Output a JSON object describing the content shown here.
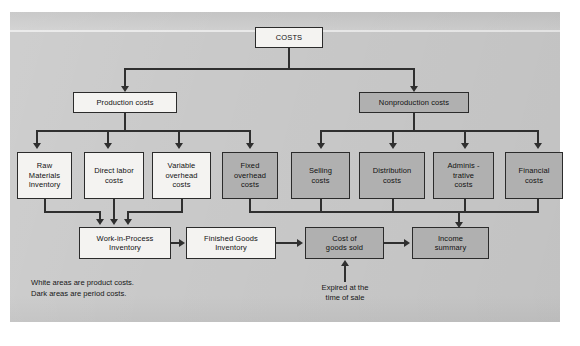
{
  "diagram": {
    "root": {
      "label": "COSTS",
      "fill": "white"
    },
    "branches": [
      {
        "label": "Production costs",
        "fill": "white"
      },
      {
        "label": "Nonproduction costs",
        "fill": "dark"
      }
    ],
    "production_children": [
      {
        "label": "Raw\nMaterials\nInventory",
        "fill": "white"
      },
      {
        "label": "Direct labor\ncosts",
        "fill": "white"
      },
      {
        "label": "Variable\noverhead\ncosts",
        "fill": "white"
      },
      {
        "label": "Fixed\noverhead\ncosts",
        "fill": "dark"
      }
    ],
    "nonproduction_children": [
      {
        "label": "Selling\ncosts",
        "fill": "dark"
      },
      {
        "label": "Distribution\ncosts",
        "fill": "dark"
      },
      {
        "label": "Adminis -\ntrative\ncosts",
        "fill": "dark"
      },
      {
        "label": "Financial\ncosts",
        "fill": "dark"
      }
    ],
    "flow": [
      {
        "label": "Work-in-Process\nInventory",
        "fill": "white"
      },
      {
        "label": "Finished Goods\nInventory",
        "fill": "white"
      },
      {
        "label": "Cost of\ngoods sold",
        "fill": "dark"
      },
      {
        "label": "Income\nsummary",
        "fill": "dark"
      }
    ],
    "annotation": "Expired at the\ntime of sale",
    "legend": "White areas are product costs.\nDark areas are period costs.",
    "colors": {
      "background": "#c9c9c9",
      "white_box": "#f4f3f1",
      "dark_box": "#b0b0b0",
      "line": "#2f2f2f",
      "text": "#111111"
    }
  }
}
